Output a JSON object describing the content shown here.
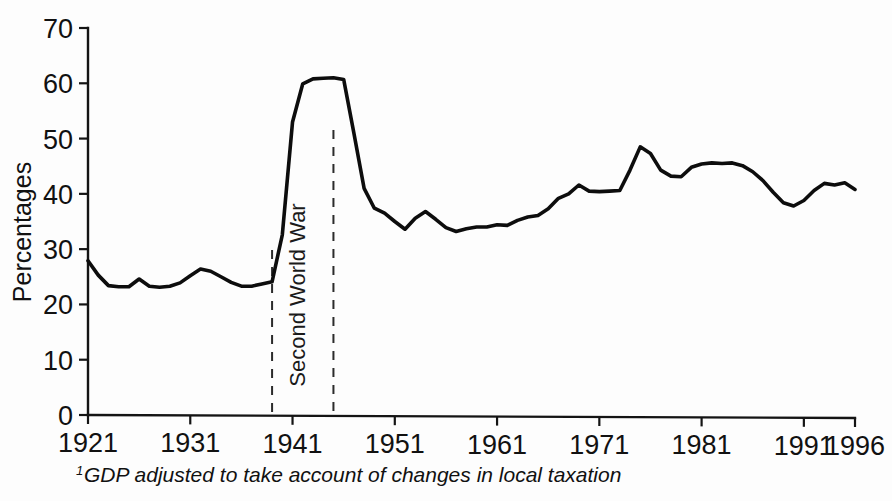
{
  "figure": {
    "ylabel": "Percentages",
    "footnote_marker": "1",
    "footnote": "GDP adjusted to take account of changes in local taxation",
    "annotation": "Second World War",
    "line_color": "#0d0d0d",
    "axis_color": "#141414",
    "background": "#fdfdfd"
  },
  "chart_data": {
    "type": "line",
    "title": "",
    "subtitle": "",
    "xlabel": "",
    "ylabel": "Percentages",
    "xlim": [
      1921,
      1996
    ],
    "ylim": [
      0,
      70
    ],
    "grid": false,
    "legend": null,
    "xticks": [
      1921,
      1931,
      1941,
      1951,
      1961,
      1971,
      1981,
      1991,
      1996
    ],
    "xtick_labels": [
      "1921",
      "1931",
      "1941",
      "1951",
      "1961",
      "1971",
      "1981",
      "1991",
      "1996"
    ],
    "yticks": [
      0,
      10,
      20,
      30,
      40,
      50,
      60,
      70
    ],
    "ytick_labels": [
      "0",
      "10",
      "20",
      "30",
      "40",
      "50",
      "60",
      "70"
    ],
    "annotations": [
      {
        "text": "Second World War",
        "orientation": "vertical",
        "span_start": 1939,
        "span_end": 1945,
        "marker_style": "dashed"
      }
    ],
    "series": [
      {
        "name": "Government expenditure as share of GDP",
        "x": [
          1921,
          1922,
          1923,
          1924,
          1925,
          1926,
          1927,
          1928,
          1929,
          1930,
          1931,
          1932,
          1933,
          1934,
          1935,
          1936,
          1937,
          1938,
          1939,
          1940,
          1941,
          1942,
          1943,
          1944,
          1945,
          1946,
          1947,
          1948,
          1949,
          1950,
          1951,
          1952,
          1953,
          1954,
          1955,
          1956,
          1957,
          1958,
          1959,
          1960,
          1961,
          1962,
          1963,
          1964,
          1965,
          1966,
          1967,
          1968,
          1969,
          1970,
          1971,
          1972,
          1973,
          1974,
          1975,
          1976,
          1977,
          1978,
          1979,
          1980,
          1981,
          1982,
          1983,
          1984,
          1985,
          1986,
          1987,
          1988,
          1989,
          1990,
          1991,
          1992,
          1993,
          1994,
          1995,
          1996
        ],
        "y": [
          27.9,
          25.3,
          23.4,
          23.2,
          23.2,
          24.6,
          23.3,
          23.1,
          23.3,
          23.9,
          25.2,
          26.4,
          26.0,
          25.0,
          24.0,
          23.3,
          23.3,
          23.7,
          24.1,
          32.6,
          53.0,
          59.9,
          60.8,
          60.9,
          61.0,
          60.7,
          51.0,
          41.0,
          37.4,
          36.5,
          35.0,
          33.6,
          35.6,
          36.8,
          35.4,
          33.9,
          33.2,
          33.7,
          34.0,
          34.0,
          34.4,
          34.3,
          35.2,
          35.8,
          36.1,
          37.3,
          39.2,
          40.0,
          41.6,
          40.5,
          40.4,
          40.5,
          40.6,
          44.3,
          48.5,
          47.3,
          44.3,
          43.2,
          43.1,
          44.8,
          45.4,
          45.6,
          45.5,
          45.6,
          45.1,
          44.0,
          42.4,
          40.3,
          38.4,
          37.8,
          38.8,
          40.6,
          41.9,
          41.6,
          42.0,
          40.8
        ]
      }
    ]
  }
}
